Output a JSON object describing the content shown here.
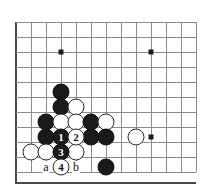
{
  "diagram": {
    "kind": "go-board-diagram",
    "board_size_shown": {
      "cols": 13,
      "rows": 11
    },
    "grid": {
      "spacing_px": 15,
      "x_lines": [
        16,
        31,
        46,
        61,
        76,
        91,
        106,
        121,
        136,
        151,
        166,
        181,
        196
      ],
      "y_lines": [
        22,
        37,
        52,
        67,
        82,
        97,
        112,
        127,
        142,
        157,
        172
      ],
      "left_edge_thick": true,
      "bottom_edge_thick": true,
      "bottom_edge_y": 182,
      "line_color": "#8b8b8b",
      "edge_color": "#4a4a4a"
    },
    "star_points": [
      {
        "x": 61,
        "y": 52
      },
      {
        "x": 151,
        "y": 52
      },
      {
        "x": 151,
        "y": 137
      }
    ],
    "stones": [
      {
        "color": "black",
        "x": 61,
        "y": 92,
        "label": ""
      },
      {
        "color": "black",
        "x": 61,
        "y": 107,
        "label": ""
      },
      {
        "color": "white",
        "x": 76,
        "y": 107,
        "label": ""
      },
      {
        "color": "black",
        "x": 46,
        "y": 122,
        "label": ""
      },
      {
        "color": "white",
        "x": 61,
        "y": 122,
        "label": ""
      },
      {
        "color": "white",
        "x": 76,
        "y": 122,
        "label": ""
      },
      {
        "color": "black",
        "x": 91,
        "y": 122,
        "label": ""
      },
      {
        "color": "white",
        "x": 106,
        "y": 122,
        "label": ""
      },
      {
        "color": "black",
        "x": 46,
        "y": 137,
        "label": ""
      },
      {
        "color": "black",
        "x": 61,
        "y": 137,
        "label": "1"
      },
      {
        "color": "white",
        "x": 76,
        "y": 137,
        "label": "2"
      },
      {
        "color": "black",
        "x": 91,
        "y": 137,
        "label": ""
      },
      {
        "color": "black",
        "x": 106,
        "y": 137,
        "label": ""
      },
      {
        "color": "white",
        "x": 136,
        "y": 137,
        "label": ""
      },
      {
        "color": "white",
        "x": 31,
        "y": 152,
        "label": ""
      },
      {
        "color": "white",
        "x": 46,
        "y": 152,
        "label": ""
      },
      {
        "color": "black",
        "x": 61,
        "y": 152,
        "label": "3"
      },
      {
        "color": "white",
        "x": 76,
        "y": 152,
        "label": ""
      },
      {
        "color": "white",
        "x": 61,
        "y": 167,
        "label": "4"
      },
      {
        "color": "black",
        "x": 106,
        "y": 167,
        "label": ""
      }
    ],
    "point_labels": [
      {
        "text": "a",
        "x": 46,
        "y": 167
      },
      {
        "text": "b",
        "x": 76,
        "y": 167
      }
    ],
    "move_numbers": [
      "1",
      "2",
      "3",
      "4"
    ],
    "colors": {
      "black_stone": "#1a1a1a",
      "white_stone": "#ffffff",
      "stone_outline": "#2b2b2b",
      "background": "#ffffff"
    }
  }
}
